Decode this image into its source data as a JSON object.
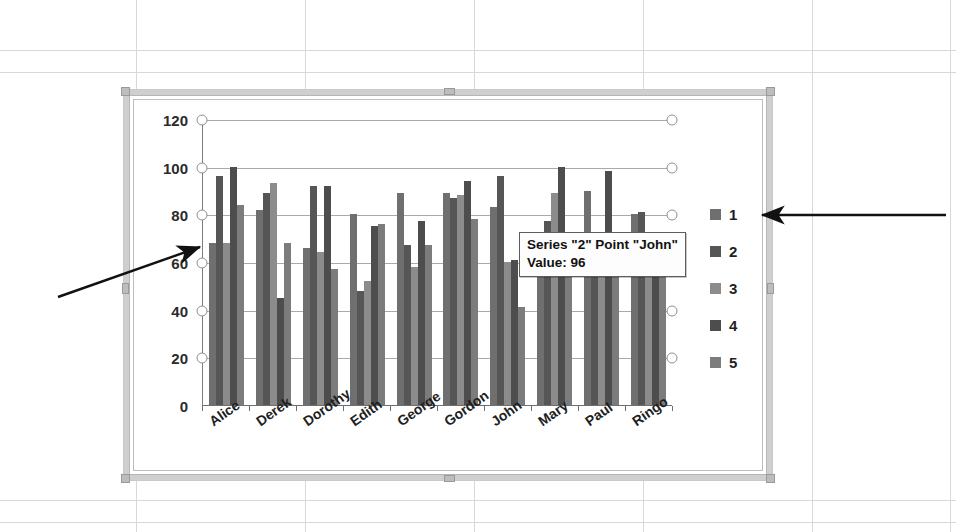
{
  "chart_data": {
    "type": "bar",
    "title": "",
    "xlabel": "",
    "ylabel": "",
    "ylim": [
      0,
      120
    ],
    "yticks": [
      0,
      20,
      40,
      60,
      80,
      100,
      120
    ],
    "grid": true,
    "legend_position": "right",
    "categories": [
      "Alice",
      "Derek",
      "Dorothy",
      "Edith",
      "George",
      "Gordon",
      "John",
      "Mary",
      "Paul",
      "Ringo"
    ],
    "series": [
      {
        "name": "1",
        "color": "#6f6f6f",
        "values": [
          68,
          82,
          66,
          80,
          89,
          89,
          83,
          63,
          90,
          80
        ]
      },
      {
        "name": "2",
        "color": "#565656",
        "values": [
          96,
          89,
          92,
          48,
          67,
          87,
          96,
          77,
          57,
          81
        ]
      },
      {
        "name": "3",
        "color": "#8c8c8c",
        "values": [
          68,
          93,
          64,
          52,
          58,
          88,
          60,
          89,
          62,
          63
        ]
      },
      {
        "name": "4",
        "color": "#4d4d4d",
        "values": [
          100,
          45,
          92,
          75,
          77,
          94,
          61,
          100,
          98,
          56
        ]
      },
      {
        "name": "5",
        "color": "#7c7c7c",
        "values": [
          84,
          68,
          57,
          76,
          67,
          78,
          41,
          62,
          58,
          60
        ]
      }
    ],
    "legend": [
      {
        "label": "1",
        "color": "#6f6f6f"
      },
      {
        "label": "2",
        "color": "#565656"
      },
      {
        "label": "3",
        "color": "#8c8c8c"
      },
      {
        "label": "4",
        "color": "#4d4d4d"
      },
      {
        "label": "5",
        "color": "#7c7c7c"
      }
    ]
  },
  "tooltip": {
    "line1": "Series \"2\" Point \"John\"",
    "line2": "Value: 96"
  },
  "annotations": [
    {
      "name": "arrow-to-first-bar",
      "note": "points at leftmost bar group"
    },
    {
      "name": "arrow-to-legend",
      "note": "points at legend entry 1"
    }
  ],
  "chart_object": {
    "state": "selected",
    "handles": 8
  }
}
